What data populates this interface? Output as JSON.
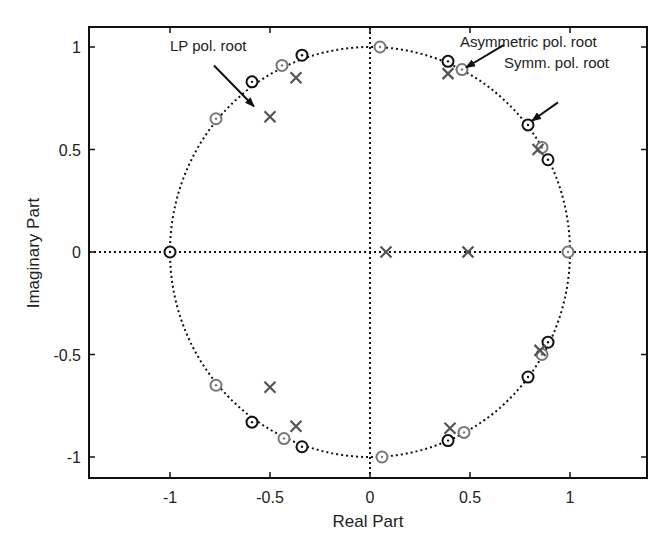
{
  "chart_data": {
    "type": "scatter",
    "title": "",
    "xlabel": "Real Part",
    "ylabel": "Imaginary Part",
    "xlim": [
      -1.4,
      1.4
    ],
    "ylim": [
      -1.1,
      1.1
    ],
    "xticks": [
      -1,
      -0.5,
      0,
      0.5,
      1
    ],
    "xtick_labels": [
      "-1",
      "-0.5",
      "0",
      "0.5",
      "1"
    ],
    "yticks": [
      1,
      0.5,
      0,
      -0.5,
      -1
    ],
    "ytick_labels": [
      "1",
      "0.5",
      "0",
      "-0.5",
      "-1"
    ],
    "grid": false,
    "unit_circle": true,
    "series": [
      {
        "name": "Symmetric polynomial zeros",
        "marker": "circle",
        "color": "#111111",
        "points": [
          [
            -1.0,
            0.0
          ],
          [
            -0.59,
            0.83
          ],
          [
            -0.59,
            -0.83
          ],
          [
            -0.34,
            0.96
          ],
          [
            -0.34,
            -0.95
          ],
          [
            0.39,
            0.93
          ],
          [
            0.39,
            -0.92
          ],
          [
            0.79,
            0.62
          ],
          [
            0.79,
            -0.61
          ],
          [
            0.89,
            0.45
          ],
          [
            0.89,
            -0.44
          ]
        ]
      },
      {
        "name": "Asymmetric polynomial zeros",
        "marker": "circle",
        "color": "#777777",
        "points": [
          [
            -0.77,
            0.65
          ],
          [
            -0.77,
            -0.65
          ],
          [
            -0.44,
            0.91
          ],
          [
            -0.43,
            -0.91
          ],
          [
            0.05,
            1.0
          ],
          [
            0.06,
            -1.0
          ],
          [
            0.46,
            0.89
          ],
          [
            0.47,
            -0.88
          ],
          [
            0.86,
            0.51
          ],
          [
            0.86,
            -0.5
          ],
          [
            0.99,
            0.0
          ]
        ]
      },
      {
        "name": "LP polynomial roots",
        "marker": "x",
        "color": "#555555",
        "points": [
          [
            -0.5,
            0.66
          ],
          [
            -0.5,
            -0.66
          ],
          [
            -0.37,
            0.85
          ],
          [
            -0.37,
            -0.85
          ],
          [
            0.39,
            0.87
          ],
          [
            0.4,
            -0.86
          ],
          [
            0.84,
            0.5
          ],
          [
            0.85,
            -0.48
          ],
          [
            0.08,
            0.0
          ],
          [
            0.49,
            0.0
          ]
        ]
      }
    ],
    "annotations": [
      {
        "text": "LP pol. root",
        "text_pos": [
          -1.0,
          0.98
        ],
        "arrow_from": [
          -0.78,
          0.91
        ],
        "arrow_to": [
          -0.58,
          0.71
        ]
      },
      {
        "text": "Asymmetric pol. root",
        "text_pos": [
          0.45,
          1.0
        ],
        "arrow_from": [
          0.67,
          1.01
        ],
        "arrow_to": [
          0.48,
          0.9
        ]
      },
      {
        "text": "Symm. pol. root",
        "text_pos": [
          0.67,
          0.9
        ],
        "arrow_from": [
          0.94,
          0.73
        ],
        "arrow_to": [
          0.81,
          0.64
        ]
      }
    ]
  }
}
